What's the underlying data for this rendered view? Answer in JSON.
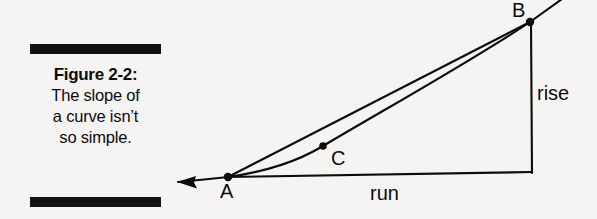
{
  "figure": {
    "caption": {
      "figure_label": "Figure 2-2:",
      "lines": [
        "The slope of",
        "a curve isn’t",
        "so simple."
      ]
    },
    "diagram": {
      "type": "geometry-diagram",
      "description": "Curve with secant line from A to B, right triangle showing rise and run",
      "points": [
        {
          "name": "A",
          "label": "A",
          "x": 228,
          "y": 177
        },
        {
          "name": "B",
          "label": "B",
          "x": 530,
          "y": 22
        },
        {
          "name": "C",
          "label": "C",
          "x": 323,
          "y": 146
        }
      ],
      "annotations": [
        {
          "name": "rise",
          "label": "rise"
        },
        {
          "name": "run",
          "label": "run"
        }
      ],
      "colors": {
        "ink": "#0c0c0c",
        "paper": "#f5f4f2"
      }
    }
  }
}
